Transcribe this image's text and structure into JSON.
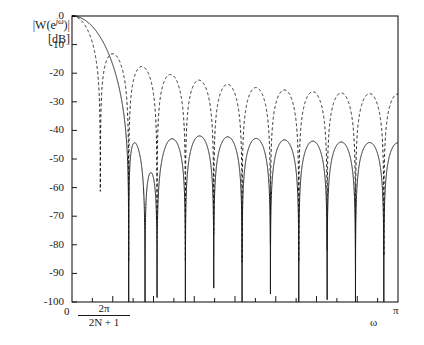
{
  "figure": {
    "background": "#ffffff",
    "line_color": "#1a1a1a",
    "width": 424,
    "height": 345
  },
  "axes": {
    "y_title_line1": "|W(e",
    "y_title_exp": "jω",
    "y_title_line1_end": ")|",
    "y_title_line2": "[dB]",
    "x_title": "ω",
    "x_zero_label": "0",
    "x_first_tick_num": "2π",
    "x_first_tick_den": "2N + 1",
    "x_end_label": "π",
    "y_ticks": [
      "0",
      "-10",
      "-20",
      "-30",
      "-40",
      "-50",
      "-60",
      "-70",
      "-80",
      "-90",
      "-100"
    ]
  },
  "chart_data": {
    "type": "line",
    "title": "",
    "xlabel": "ω",
    "ylabel": "|W(e^{jω})| [dB]",
    "xlim": [
      0,
      3.14159265
    ],
    "ylim": [
      -100,
      0
    ],
    "ytick_values": [
      0,
      -10,
      -20,
      -30,
      -40,
      -50,
      -60,
      -70,
      -80,
      -90,
      -100
    ],
    "xtick_values": [
      0,
      0.2856,
      0.5712,
      0.8568,
      1.1424,
      1.428,
      1.7136,
      1.9992,
      2.2848,
      2.5704,
      2.856,
      3.14159265
    ],
    "xtick_labels": [
      "0",
      "2π/(2N+1)",
      "",
      "",
      "",
      "",
      "",
      "",
      "",
      "",
      "",
      "π"
    ],
    "grid": false,
    "legend": null,
    "series": [
      {
        "name": "rectangular-window",
        "style": "dashed",
        "color": "#1a1a1a",
        "description": "Dirichlet kernel magnitude for N=11 (2N+1=23 point rectangular window), first sidelobe about -13 dB at the main lobe edge, sidelobe envelope decaying from about -21 dB to about -30 dB toward pi, nulls reaching below -80 dB",
        "main_lobe_null_x": 0.2856,
        "first_sidelobe_db": -21,
        "last_sidelobe_db": -30,
        "num_sidelobes": 11
      },
      {
        "name": "tapered-window",
        "style": "solid",
        "color": "#1a1a1a",
        "description": "Hamming-type tapered window magnitude, wider main lobe reaching the first null near 0.57, nearly constant sidelobe plateau between about -44 dB and -47 dB out to pi, deep nulls to between -70 dB and -100 dB",
        "main_lobe_null_x": 0.5712,
        "first_sidelobe_db": -44,
        "last_sidelobe_db": -47,
        "num_sidelobes": 11
      }
    ]
  },
  "plot_geometry": {
    "left": 72,
    "right": 398,
    "top": 16,
    "bottom": 302
  }
}
